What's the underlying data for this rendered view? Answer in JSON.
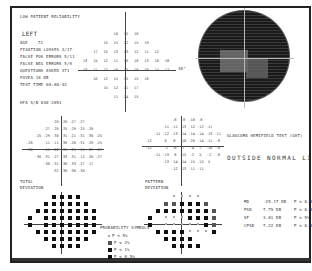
{
  "header": {
    "reliability_note": "LOW PATIENT RELIABILITY",
    "eye": "LEFT",
    "age_label": "AGE",
    "age_value": "71",
    "fixation_losses": "FIXATION LOSSES  3/17",
    "false_pos": "FALSE POS ERRORS  5/11",
    "false_neg": "FALSE NEG ERRORS  5/9",
    "questions_asked": "QUESTIONS ASKED  371",
    "fovea": "FOVEA  18 DB",
    "test_time": "TEST TIME 00:08:42",
    "hfa": "HFA S/N  840-2051"
  },
  "threshold_grid": {
    "rows": [
      [
        "",
        "",
        "",
        "10",
        "15",
        "10",
        "",
        "",
        ""
      ],
      [
        "",
        "",
        "15",
        "15",
        "12",
        "15",
        "19",
        "",
        ""
      ],
      [
        "",
        "17",
        "15",
        "13",
        "13",
        "12",
        "11",
        "12",
        ""
      ],
      [
        "13",
        "15",
        "12",
        "11",
        "16",
        "16",
        "13",
        "16",
        "18"
      ],
      [
        "13",
        "11",
        "12",
        "<0",
        "15",
        "16",
        "16",
        "14",
        "12"
      ],
      [
        "",
        "10",
        "12",
        "15",
        "15",
        "15",
        "16",
        "",
        ""
      ],
      [
        "",
        "",
        "15",
        "12",
        "11",
        "17",
        "",
        "",
        ""
      ],
      [
        "",
        "",
        "",
        "11",
        "14",
        "15",
        "",
        "",
        ""
      ]
    ],
    "axis_label": "30°"
  },
  "grayscale": {
    "caption": "GLAUCOMA HEMIFIELD TEST (GHT)"
  },
  "ght_result": "OUTSIDE NORMAL LIMITS",
  "total_deviation": {
    "label_line1": "TOTAL",
    "label_line2": "DEVIATION",
    "rows": [
      [
        "",
        "",
        "",
        "-20",
        "-20",
        "-27",
        "-27",
        "",
        ""
      ],
      [
        "",
        "",
        "-27",
        "-20",
        "-25",
        "-29",
        "-25",
        "-20",
        ""
      ],
      [
        "",
        "-25",
        "-29",
        "-30",
        "-31",
        "-21",
        "-31",
        "-30",
        "-25"
      ],
      [
        "-26",
        "",
        "-11",
        "-11",
        "-30",
        "-26",
        "-31",
        "-29",
        "-25"
      ],
      [
        "-30",
        "",
        "-11",
        "-22",
        "-31",
        "-21",
        "-11",
        "-27",
        "-27"
      ],
      [
        "",
        "-30",
        "-31",
        "-27",
        "-33",
        "-31",
        "-12",
        "-20",
        "-27"
      ],
      [
        "",
        "",
        "-30",
        "-31",
        "-30",
        "-33",
        "-27",
        "-17",
        ""
      ],
      [
        "",
        "",
        "",
        "-32",
        "-30",
        "-30",
        "-30",
        "",
        ""
      ]
    ]
  },
  "pattern_deviation": {
    "label_line1": "PATTERN",
    "label_line2": "DEVIATION",
    "rows": [
      [
        "",
        "",
        "",
        "-8",
        "-8",
        "-10",
        "-8",
        "",
        ""
      ],
      [
        "",
        "",
        "-11",
        "-11",
        "-13",
        "-12",
        "-12",
        "-11",
        ""
      ],
      [
        "",
        "-11",
        "-12",
        "-13",
        "-14",
        "-14",
        "-14",
        "-13",
        "-11"
      ],
      [
        "-12",
        "",
        "6",
        "8",
        "-16",
        "-20",
        "-14",
        "-11",
        "-8"
      ],
      [
        "-12",
        "",
        "-2",
        "-8",
        "7",
        "-4",
        "7",
        "-10",
        "-8"
      ],
      [
        "",
        "-11",
        "-13",
        "-8",
        "-15",
        "-2",
        "5",
        "-2",
        "-8"
      ],
      [
        "",
        "",
        "-13",
        "-14",
        "-14",
        "-15",
        "-15",
        "5",
        ""
      ],
      [
        "",
        "",
        "",
        "-12",
        "-13",
        "-11",
        "-11",
        "",
        ""
      ]
    ]
  },
  "total_prob_rows": [
    [
      "",
      "",
      "",
      "b",
      "b",
      "b",
      "b",
      "",
      ""
    ],
    [
      "",
      "",
      "b",
      "b",
      "b",
      "b",
      "b",
      "b",
      ""
    ],
    [
      "",
      "b",
      "b",
      "b",
      "b",
      "b",
      "b",
      "b",
      "b"
    ],
    [
      "b",
      "",
      "b",
      "b",
      "b",
      "b",
      "b",
      "b",
      "b"
    ],
    [
      "b",
      "",
      "b",
      "b",
      "b",
      "b",
      "b",
      "b",
      "b"
    ],
    [
      "",
      "b",
      "b",
      "b",
      "b",
      "b",
      "b",
      "b",
      "b"
    ],
    [
      "",
      "",
      "b",
      "b",
      "b",
      "b",
      "b",
      "b",
      ""
    ],
    [
      "",
      "",
      "",
      "b",
      "b",
      "b",
      "b",
      "",
      ""
    ]
  ],
  "pattern_prob_rows": [
    [
      "",
      "",
      "",
      "l",
      "l",
      "l",
      "l",
      "",
      ""
    ],
    [
      "",
      "",
      "d",
      "d",
      "b",
      "b",
      "b",
      "d",
      ""
    ],
    [
      "",
      "b",
      "b",
      "b",
      "b",
      "b",
      "b",
      "b",
      "d"
    ],
    [
      "b",
      "",
      "l",
      "l",
      "l",
      "b",
      "b",
      "b",
      "d"
    ],
    [
      "b",
      "",
      "l",
      "l",
      "l",
      "l",
      "l",
      "b",
      "d"
    ],
    [
      "",
      "b",
      "b",
      "b",
      "b",
      "l",
      "l",
      "l",
      "b"
    ],
    [
      "",
      "",
      "b",
      "b",
      "b",
      "b",
      "",
      "",
      ""
    ],
    [
      "",
      "",
      "",
      "b",
      "b",
      "b",
      "b",
      "",
      ""
    ]
  ],
  "probability_legend": {
    "title": "PROBABILITY SYMBOLS",
    "items": [
      {
        "symbol": "l",
        "label": "P < 5%"
      },
      {
        "symbol": "d",
        "label": "P < 2%"
      },
      {
        "symbol": "b",
        "label": "P < 1%"
      },
      {
        "symbol": "b",
        "label": "P < 0.5%"
      }
    ]
  },
  "global_indices": [
    {
      "name": "MD",
      "value": "-25.17 DB",
      "p": "P < 0.5%"
    },
    {
      "name": "PSD",
      "value": "7.79 DB",
      "p": "P < 0.5%"
    },
    {
      "name": "SF",
      "value": "3.01 DB",
      "p": "P < 5%"
    },
    {
      "name": "CPSD",
      "value": "7.22 DB",
      "p": "P < 0.5%"
    }
  ]
}
